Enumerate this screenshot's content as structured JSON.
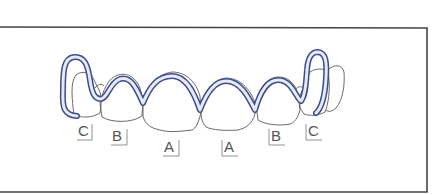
{
  "figure": {
    "colors": {
      "frame": "#444444",
      "tooth_outline": "#5a5a5a",
      "wire_outline": "#3d4c8c",
      "wire_fill": "#e6ebf7",
      "label_text": "#555555"
    }
  },
  "labels": [
    {
      "id": "C-left",
      "text": "C"
    },
    {
      "id": "B-left",
      "text": "B"
    },
    {
      "id": "A-left",
      "text": "A"
    },
    {
      "id": "A-right",
      "text": "A"
    },
    {
      "id": "B-right",
      "text": "B"
    },
    {
      "id": "C-right",
      "text": "C"
    }
  ]
}
